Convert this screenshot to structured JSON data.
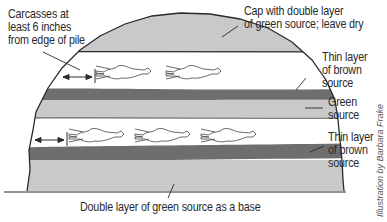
{
  "diagram": {
    "labels": {
      "carcass_distance": [
        "Carcasses at",
        "least 6 inches",
        "from edge of pile"
      ],
      "cap": [
        "Cap with double layer",
        "of green source; leave dry"
      ],
      "thin_brown_upper": [
        "Thin layer",
        "of brown",
        "source"
      ],
      "green_middle": [
        "Green",
        "source"
      ],
      "thin_brown_lower": [
        "Thin layer",
        "of brown",
        "source"
      ],
      "base": [
        "Double layer of green source as a base"
      ]
    },
    "credit": "Illustration by Barbara Frake",
    "layers": [
      {
        "name": "cap",
        "material": "green source (double layer)"
      },
      {
        "name": "upper-carcass-layer",
        "material": "carcasses",
        "carcass_count": 2
      },
      {
        "name": "upper-brown-layer",
        "material": "brown source (thin)"
      },
      {
        "name": "middle-green-layer",
        "material": "green source"
      },
      {
        "name": "lower-carcass-layer",
        "material": "carcasses",
        "carcass_count": 3
      },
      {
        "name": "lower-brown-layer",
        "material": "brown source (thin)"
      },
      {
        "name": "base",
        "material": "green source (double layer)"
      }
    ],
    "colors": {
      "green_source": "#c9c9c9",
      "brown_source": "#6e6e6e",
      "carcass_layer": "#ffffff",
      "outline": "#2a2a2a"
    }
  }
}
